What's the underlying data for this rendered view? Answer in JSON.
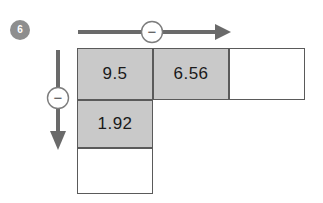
{
  "exercise": {
    "number": "6"
  },
  "colors": {
    "filled_cell": "#c9c9c9",
    "empty_cell": "#ffffff",
    "grid_line": "#5a5a5a",
    "arrow": "#6a6a6a",
    "badge": "#8e8e8e"
  },
  "operators": {
    "horizontal": {
      "symbol": "−",
      "name": "minus-operator",
      "direction": "right"
    },
    "vertical": {
      "symbol": "−",
      "name": "minus-operator",
      "direction": "down"
    }
  },
  "grid": {
    "columns": 3,
    "rows": 3,
    "cells": [
      [
        {
          "value": "9.5",
          "filled": true,
          "present": true
        },
        {
          "value": "6.56",
          "filled": true,
          "present": true
        },
        {
          "value": "",
          "filled": false,
          "present": true
        }
      ],
      [
        {
          "value": "1.92",
          "filled": true,
          "present": true
        },
        {
          "value": "",
          "filled": false,
          "present": false
        },
        {
          "value": "",
          "filled": false,
          "present": false
        }
      ],
      [
        {
          "value": "",
          "filled": false,
          "present": true
        },
        {
          "value": "",
          "filled": false,
          "present": false
        },
        {
          "value": "",
          "filled": false,
          "present": false
        }
      ]
    ]
  }
}
